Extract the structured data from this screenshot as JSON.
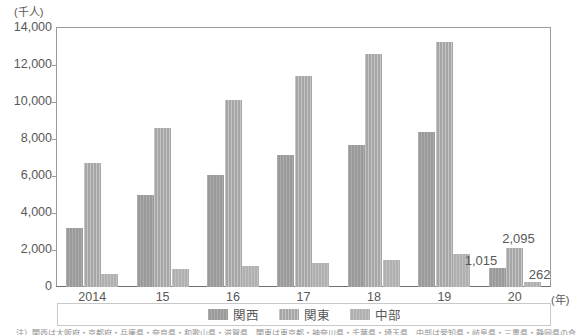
{
  "chart_data": {
    "type": "bar",
    "title": "",
    "xlabel": "(年)",
    "ylabel": "(千人)",
    "categories": [
      "2014",
      "15",
      "16",
      "17",
      "18",
      "19",
      "20"
    ],
    "ylim": [
      0,
      14000
    ],
    "y_ticks": [
      "0",
      "2,000",
      "4,000",
      "6,000",
      "8,000",
      "10,000",
      "12,000",
      "14,000"
    ],
    "y_tick_values": [
      0,
      2000,
      4000,
      6000,
      8000,
      10000,
      12000,
      14000
    ],
    "grid": false,
    "legend_position": "bottom",
    "series": [
      {
        "name": "関西",
        "color": "#9d9d9d",
        "values": [
          3200,
          4950,
          6050,
          7150,
          7650,
          8400,
          1015
        ]
      },
      {
        "name": "関東",
        "color": "#a8a8a8",
        "values": [
          6700,
          8600,
          10100,
          11400,
          12600,
          13250,
          2095
        ]
      },
      {
        "name": "中部",
        "color": "#b4b4b4",
        "values": [
          700,
          1000,
          1150,
          1300,
          1450,
          1800,
          262
        ]
      }
    ],
    "annotations": [
      {
        "text": "1,015",
        "series": "関西",
        "category": "20"
      },
      {
        "text": "2,095",
        "series": "関東",
        "category": "20"
      },
      {
        "text": "262",
        "series": "中部",
        "category": "20"
      }
    ]
  },
  "axis": {
    "y_unit_label": "(千人)",
    "x_unit_label": "(年)"
  },
  "legend": {
    "items": [
      {
        "label": "関西",
        "swatch": "kansai-swatch"
      },
      {
        "label": "関東",
        "swatch": "kanto-swatch"
      },
      {
        "label": "中部",
        "swatch": "chubu-swatch"
      }
    ]
  },
  "footnote": {
    "text": "注）関西は大阪府・京都府・兵庫県・奈良県・和歌山県・滋賀県、関東は東京都・神奈川県・千葉県・埼玉県、中部は愛知県・岐阜県・三重県・静岡県の合計値。"
  }
}
